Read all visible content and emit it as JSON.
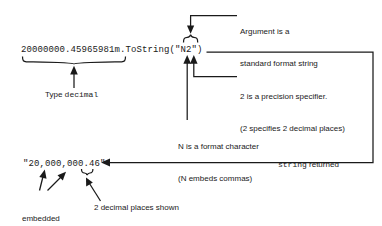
{
  "diagram": {
    "ink_color": "#1a1a1a",
    "background_color": "#ffffff"
  },
  "code": {
    "expression": "20000000.45965981m.ToString(\"N2\")",
    "value_literal": "20000000.45965981m",
    "method": ".ToString",
    "argument": "\"N2\""
  },
  "result": {
    "string_literal": "\"20,000,000.46\""
  },
  "annotations": {
    "argument": {
      "line1": "Argument is a",
      "line2": "standard format string"
    },
    "type_decimal": {
      "prefix": "Type ",
      "keyword": "decimal"
    },
    "precision": {
      "line1": "2 is a precision specifier.",
      "line2": "(2 specifies 2 decimal places)"
    },
    "format_character": {
      "line1": "N is a format character",
      "line2": "(N embeds commas)"
    },
    "string_returned": {
      "keyword": "string",
      "suffix": " returned"
    },
    "embedded_commas": {
      "line1": "embedded",
      "line2": "commas"
    },
    "decimal_places": {
      "text": "2 decimal places shown"
    }
  }
}
